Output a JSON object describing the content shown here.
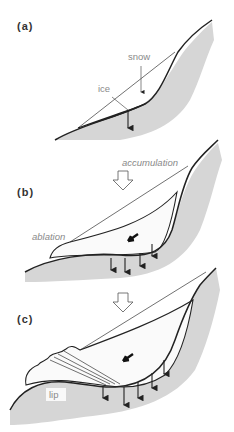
{
  "figure": {
    "panels": [
      {
        "label": "(a)",
        "annotations": [
          "snow",
          "ice"
        ]
      },
      {
        "label": "(b)",
        "annotations": [
          "accumulation",
          "ablation"
        ]
      },
      {
        "label": "(c)",
        "annotations": [
          "lip"
        ]
      }
    ],
    "colors": {
      "rock_fill": "#d6d6d6",
      "line": "#222222",
      "label_text": "#8a8a8a",
      "panel_label_text": "#333333"
    }
  }
}
